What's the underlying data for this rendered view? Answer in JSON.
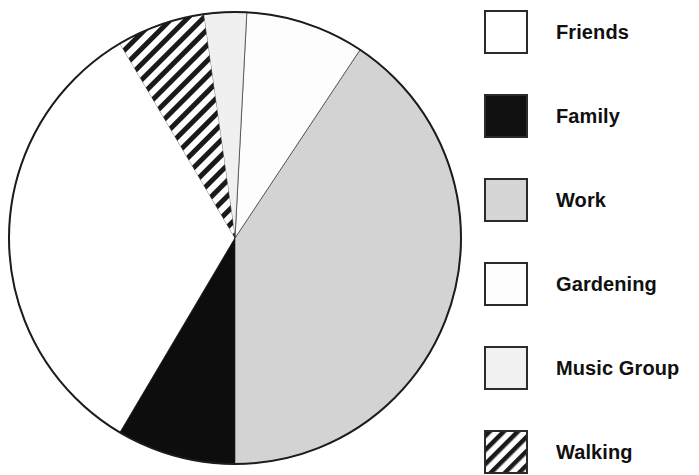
{
  "chart_data": {
    "type": "pie",
    "title": "",
    "subtitle": "",
    "xlabel": "",
    "ylabel": "",
    "legend_position": "right",
    "grid": false,
    "categories": [
      "Friends",
      "Family",
      "Work",
      "Gardening",
      "Music Group",
      "Walking"
    ],
    "values": [
      19,
      8,
      47,
      13,
      7,
      6
    ],
    "units": "percent",
    "start_angle_deg": -30.6,
    "direction": "clockwise",
    "slices": [
      {
        "label": "Friends",
        "value": 19,
        "fill": "#ffffff",
        "pattern": "solid",
        "start_angle_deg": 210.6,
        "end_angle_deg": 329.4
      },
      {
        "label": "Family",
        "value": 8,
        "fill": "#0d0d0d",
        "pattern": "solid",
        "start_angle_deg": 180.0,
        "end_angle_deg": 210.6
      },
      {
        "label": "Work",
        "value": 47,
        "fill": "#d3d3d3",
        "pattern": "solid",
        "start_angle_deg": 33.6,
        "end_angle_deg": 180.0
      },
      {
        "label": "Gardening",
        "value": 13,
        "fill": "#fdfdfd",
        "pattern": "solid",
        "start_angle_deg": 3.0,
        "end_angle_deg": 33.6
      },
      {
        "label": "Music Group",
        "value": 7,
        "fill": "#f0f0f0",
        "pattern": "solid",
        "start_angle_deg": -8.0,
        "end_angle_deg": 3.0
      },
      {
        "label": "Walking",
        "value": 6,
        "fill": "#ffffff",
        "pattern": "diagonal-hatch",
        "start_angle_deg": -30.6,
        "end_angle_deg": -8.0
      }
    ],
    "geometry": {
      "center_x": 235,
      "center_y": 238,
      "radius": 226,
      "stroke": "#1c1c1c",
      "stroke_width": 2
    }
  },
  "legend": {
    "items": [
      {
        "label": "Friends",
        "swatch": "white-swatch",
        "fill": "#ffffff",
        "pattern": "solid",
        "top": 9
      },
      {
        "label": "Family",
        "swatch": "black-swatch",
        "fill": "#111111",
        "pattern": "solid",
        "top": 93
      },
      {
        "label": "Work",
        "swatch": "gray-swatch",
        "fill": "#d6d6d6",
        "pattern": "solid",
        "top": 177
      },
      {
        "label": "Gardening",
        "swatch": "white-swatch",
        "fill": "#fdfdfd",
        "pattern": "solid",
        "top": 261
      },
      {
        "label": "Music Group",
        "swatch": "light-gray-swatch",
        "fill": "#f1f1f1",
        "pattern": "solid",
        "top": 345
      },
      {
        "label": "Walking",
        "swatch": "hatched-swatch",
        "fill": "#ffffff",
        "pattern": "diagonal-hatch",
        "top": 429
      }
    ]
  },
  "colors": {
    "outline": "#1c1c1c",
    "text": "#101010",
    "background": "#ffffff",
    "work_gray": "#d3d3d3",
    "family_black": "#0d0d0d",
    "music_group_light": "#f0f0f0"
  }
}
